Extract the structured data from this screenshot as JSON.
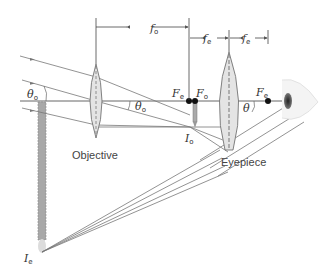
{
  "diagram": {
    "labels": {
      "objective": "Objective",
      "eyepiece": "Eyepiece"
    },
    "dimensions": {
      "f_o": {
        "main": "f",
        "sub": "o"
      },
      "f_e_left": {
        "main": "f",
        "sub": "e"
      },
      "f_e_right": {
        "main": "f",
        "sub": "e"
      }
    },
    "focal_points": {
      "Fe_left": {
        "main": "F",
        "sub": "e"
      },
      "Fo": {
        "main": "F",
        "sub": "o"
      },
      "Fe_right": {
        "main": "F",
        "sub": "e"
      }
    },
    "angles": {
      "theta_o_left": {
        "main": "θ",
        "sub": "o"
      },
      "theta_o_mid": {
        "main": "θ",
        "sub": "o"
      },
      "theta": {
        "main": "θ",
        "sub": ""
      }
    },
    "images": {
      "Io": {
        "main": "I",
        "sub": "o"
      },
      "Ie": {
        "main": "I",
        "sub": "e"
      }
    },
    "colors": {
      "lens_fill": "#e4e4e4",
      "ray": "#777777",
      "image_column": "#a8a8a8"
    }
  }
}
